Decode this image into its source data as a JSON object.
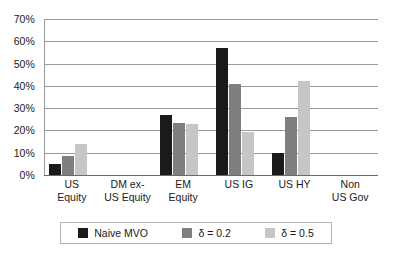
{
  "chart_data": {
    "type": "bar",
    "title": "",
    "subtitle": "",
    "xlabel": "",
    "ylabel": "",
    "ylim": [
      0,
      0.7
    ],
    "grid": true,
    "legend_position": "bottom",
    "y_tick_labels": [
      "70%",
      "60%",
      "50%",
      "40%",
      "30%",
      "20%",
      "10%",
      "0%"
    ],
    "y_tick_values": [
      0.7,
      0.6,
      0.5,
      0.4,
      0.3,
      0.2,
      0.1,
      0.0
    ],
    "categories": [
      "US Equity",
      "DM ex-US Equity",
      "EM Equity",
      "US IG",
      "US HY",
      "Non US Gov"
    ],
    "category_label_lines": [
      [
        "US",
        "Equity"
      ],
      [
        "DM ex-",
        "US Equity"
      ],
      [
        "EM",
        "Equity"
      ],
      [
        "US IG",
        ""
      ],
      [
        "US HY",
        ""
      ],
      [
        "Non",
        "US Gov"
      ]
    ],
    "series": [
      {
        "name": "Naive MVO",
        "color": "#1a1a1a",
        "values": [
          0.05,
          0.0,
          0.27,
          0.57,
          0.1,
          0.0
        ]
      },
      {
        "name": "δ = 0.2",
        "color": "#7f7f7f",
        "values": [
          0.085,
          0.0,
          0.235,
          0.41,
          0.26,
          0.0
        ]
      },
      {
        "name": "δ = 0.5",
        "color": "#c6c6c6",
        "values": [
          0.14,
          0.0,
          0.23,
          0.195,
          0.42,
          0.0
        ]
      }
    ]
  },
  "legend": {
    "items": [
      {
        "label": "Naive MVO",
        "color": "#1a1a1a"
      },
      {
        "label": "δ = 0.2",
        "color": "#7f7f7f"
      },
      {
        "label": "δ = 0.5",
        "color": "#c6c6c6"
      }
    ]
  },
  "colors": {
    "series_0": "#1a1a1a",
    "series_1": "#7f7f7f",
    "series_2": "#c6c6c6",
    "gridline": "#9a9a9a",
    "background": "#ffffff",
    "text": "#1a1a1a"
  }
}
